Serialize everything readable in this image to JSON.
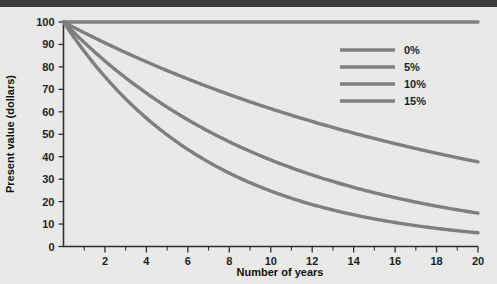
{
  "figure": {
    "background_color": "#e9e9e7",
    "top_rule_color": "#3b3b3b",
    "curve_color": "#7f7f7f",
    "axis_color": "#2f2f2f",
    "text_color": "#1f1f1f"
  },
  "chart_data": {
    "type": "line",
    "title": "",
    "xlabel": "Number of years",
    "ylabel": "Present value (dollars)",
    "xlim": [
      0,
      20
    ],
    "ylim": [
      0,
      100
    ],
    "grid": false,
    "legend_position": "top-right",
    "x_major_ticks": [
      0,
      2,
      4,
      6,
      8,
      10,
      12,
      14,
      16,
      18,
      20
    ],
    "x_major_tick_labels": [
      "0",
      "2",
      "4",
      "6",
      "8",
      "10",
      "12",
      "14",
      "16",
      "18",
      "20"
    ],
    "x_minor_ticks": [
      1,
      3,
      5,
      7,
      9,
      11,
      13,
      15,
      17,
      19
    ],
    "y_major_ticks": [
      0,
      10,
      20,
      30,
      40,
      50,
      60,
      70,
      80,
      90,
      100
    ],
    "y_major_tick_labels": [
      "0",
      "10",
      "20",
      "30",
      "40",
      "50",
      "60",
      "70",
      "80",
      "90",
      "100"
    ],
    "x": [
      0,
      1,
      2,
      3,
      4,
      5,
      6,
      7,
      8,
      9,
      10,
      11,
      12,
      13,
      14,
      15,
      16,
      17,
      18,
      19,
      20
    ],
    "series": [
      {
        "name": "0%",
        "rate": 0.0,
        "color": "#7f7f7f",
        "values": [
          100,
          100,
          100,
          100,
          100,
          100,
          100,
          100,
          100,
          100,
          100,
          100,
          100,
          100,
          100,
          100,
          100,
          100,
          100,
          100,
          100
        ]
      },
      {
        "name": "5%",
        "rate": 0.05,
        "color": "#7f7f7f",
        "values": [
          100,
          95.2,
          90.7,
          86.4,
          82.3,
          78.4,
          74.6,
          71.1,
          67.7,
          64.5,
          61.4,
          58.5,
          55.7,
          53.0,
          50.5,
          48.1,
          45.8,
          43.6,
          41.6,
          39.6,
          37.7
        ]
      },
      {
        "name": "10%",
        "rate": 0.1,
        "color": "#7f7f7f",
        "values": [
          100,
          90.9,
          82.6,
          75.1,
          68.3,
          62.1,
          56.4,
          51.3,
          46.7,
          42.4,
          38.6,
          35.0,
          31.9,
          29.0,
          26.3,
          23.9,
          21.8,
          19.8,
          18.0,
          16.4,
          14.9
        ]
      },
      {
        "name": "15%",
        "rate": 0.15,
        "color": "#7f7f7f",
        "values": [
          100,
          87.0,
          75.6,
          65.8,
          57.2,
          49.7,
          43.2,
          37.6,
          32.7,
          28.4,
          24.7,
          21.5,
          18.7,
          16.3,
          14.1,
          12.3,
          10.7,
          9.3,
          8.1,
          7.0,
          6.1
        ]
      }
    ],
    "legend": [
      {
        "label": "0%"
      },
      {
        "label": "5%"
      },
      {
        "label": "10%"
      },
      {
        "label": "15%"
      }
    ]
  }
}
